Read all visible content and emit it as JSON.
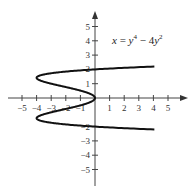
{
  "chart_data": {
    "type": "line",
    "title": "",
    "xlabel": "",
    "ylabel": "",
    "xlim": [
      -5.5,
      6
    ],
    "ylim": [
      -5.8,
      5.8
    ],
    "grid": false,
    "x_ticks": [
      -5,
      -4,
      -3,
      -2,
      -1,
      1,
      2,
      3,
      4,
      5
    ],
    "y_ticks": [
      -5,
      -4,
      -3,
      -2,
      1,
      2,
      3,
      4,
      5
    ],
    "x_tick_labels": [
      "−5",
      "−4",
      "−3",
      "−2",
      "−1",
      "1",
      "2",
      "3",
      "4",
      "5"
    ],
    "y_tick_labels": [
      "−5",
      "−4",
      "−3",
      "−2",
      "1",
      "2",
      "3",
      "4",
      "5"
    ],
    "series": [
      {
        "name": "x = y^4 - 4y^2",
        "equation": "x = y⁴ − 4y²",
        "parametric_in": "y",
        "y_range": [
          -2.2,
          2.2
        ],
        "points": [
          {
            "y": -2.2,
            "x": 4.07
          },
          {
            "y": -2.1,
            "x": 1.81
          },
          {
            "y": -2.0,
            "x": 0
          },
          {
            "y": -1.8,
            "x": -2.46
          },
          {
            "y": -1.6,
            "x": -3.69
          },
          {
            "y": -1.414,
            "x": -4
          },
          {
            "y": -1.2,
            "x": -3.69
          },
          {
            "y": -1.0,
            "x": -3
          },
          {
            "y": -0.8,
            "x": -2.15
          },
          {
            "y": -0.5,
            "x": -0.94
          },
          {
            "y": 0,
            "x": 0
          },
          {
            "y": 0.5,
            "x": -0.94
          },
          {
            "y": 0.8,
            "x": -2.15
          },
          {
            "y": 1.0,
            "x": -3
          },
          {
            "y": 1.2,
            "x": -3.69
          },
          {
            "y": 1.414,
            "x": -4
          },
          {
            "y": 1.6,
            "x": -3.69
          },
          {
            "y": 1.8,
            "x": -2.46
          },
          {
            "y": 2.0,
            "x": 0
          },
          {
            "y": 2.1,
            "x": 1.81
          },
          {
            "y": 2.2,
            "x": 4.07
          }
        ]
      }
    ],
    "annotations": [
      {
        "text": "x = y⁴ − 4y²",
        "position": "upper right, near (2.5, 2.8)"
      }
    ]
  },
  "labels": {
    "eq_x": "x",
    "eq_eq": " = ",
    "eq_y1": "y",
    "eq_exp1": "4",
    "eq_minus": " − 4",
    "eq_y2": "y",
    "eq_exp2": "2"
  }
}
